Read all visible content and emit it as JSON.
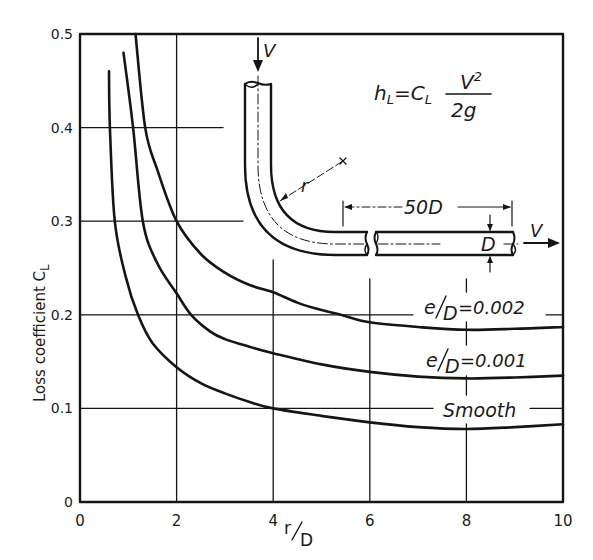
{
  "chart_data": {
    "type": "line",
    "title": "",
    "xlabel": "r/D",
    "ylabel": "Loss coefficient C_L",
    "xlim": [
      0,
      10
    ],
    "ylim": [
      0,
      0.5
    ],
    "grid": true,
    "x_ticks": [
      0,
      2,
      4,
      6,
      8,
      10
    ],
    "x_tick_labels": [
      "0",
      "2",
      "4",
      "6",
      "8",
      "10"
    ],
    "y_ticks": [
      0,
      0.1,
      0.2,
      0.3,
      0.4,
      0.5
    ],
    "y_tick_labels": [
      "0",
      "0.1",
      "0.2",
      "0.3",
      "0.4",
      "0.5"
    ],
    "legend_position": "inline labels on right side of curves",
    "series": [
      {
        "name": "e/D = 0.002",
        "label": "e/D=0.002",
        "x": [
          1.15,
          1.35,
          1.6,
          2.0,
          2.5,
          3.0,
          3.5,
          4.0,
          4.5,
          5.0,
          5.4,
          6.0,
          7.0,
          8.0,
          9.0,
          10.0
        ],
        "y": [
          0.5,
          0.4,
          0.355,
          0.3,
          0.265,
          0.245,
          0.232,
          0.224,
          0.213,
          0.205,
          0.2,
          0.192,
          0.187,
          0.184,
          0.185,
          0.187
        ]
      },
      {
        "name": "e/D = 0.001",
        "label": "e/D=0.001",
        "x": [
          0.9,
          1.1,
          1.3,
          1.6,
          2.0,
          2.3,
          2.7,
          3.0,
          3.5,
          4.0,
          5.0,
          6.0,
          7.0,
          8.0,
          9.0,
          10.0
        ],
        "y": [
          0.48,
          0.4,
          0.3,
          0.255,
          0.223,
          0.2,
          0.182,
          0.174,
          0.166,
          0.159,
          0.147,
          0.139,
          0.134,
          0.132,
          0.133,
          0.135
        ]
      },
      {
        "name": "Smooth",
        "label": "Smooth",
        "x": [
          0.6,
          0.62,
          0.72,
          0.95,
          1.2,
          1.5,
          2.0,
          2.5,
          3.0,
          3.5,
          4.0,
          5.0,
          6.0,
          7.0,
          8.0,
          9.0,
          10.0
        ],
        "y": [
          0.46,
          0.4,
          0.3,
          0.24,
          0.2,
          0.17,
          0.144,
          0.127,
          0.116,
          0.107,
          0.1,
          0.092,
          0.085,
          0.08,
          0.078,
          0.08,
          0.083
        ]
      }
    ],
    "annotations": [
      "h_L = C_L V^2 / 2g",
      "V (inflow arrow, downward)",
      "V (outflow arrow, rightward)",
      "r (bend radius)",
      "50D (downstream straight length)",
      "D (pipe diameter)"
    ]
  },
  "labels": {
    "ylabel_main": "Loss coefficient C",
    "ylabel_sub": "L",
    "xlabel_r": "r",
    "xlabel_D": "D",
    "series_labels": {
      "s002_e": "e",
      "s002_D": "D",
      "s002_val": "=0.002",
      "s001_e": "e",
      "s001_D": "D",
      "s001_val": "=0.001",
      "smooth": "Smooth"
    },
    "equation": {
      "lhs": "h",
      "lhs_sub": "L",
      "eq": "=C",
      "c_sub": "L",
      "numerator": "V",
      "numerator_sup": "2",
      "denominator": "2g"
    },
    "diagram": {
      "v_in": "V",
      "v_out": "V",
      "radius": "r",
      "length": "50D",
      "diameter": "D"
    }
  }
}
